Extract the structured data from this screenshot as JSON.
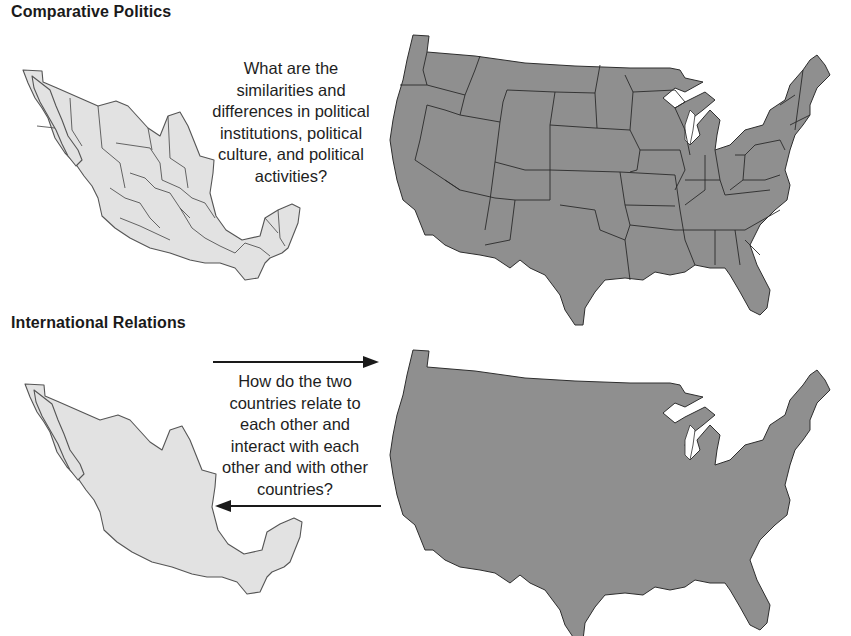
{
  "sections": [
    {
      "title": "Comparative Politics",
      "question_lines": [
        "What are the",
        "similarities and",
        "differences in political",
        "institutions, political",
        "culture, and political",
        "activities?"
      ],
      "left_map": "mexico-with-state-borders",
      "right_map": "usa-with-state-borders"
    },
    {
      "title": "International Relations",
      "question_lines": [
        "How do the two",
        "countries relate to",
        "each other and",
        "interact with each",
        "other and with other",
        "countries?"
      ],
      "left_map": "mexico-outline",
      "right_map": "usa-outline",
      "arrows": [
        "arrow-right-to-usa",
        "arrow-left-to-mexico"
      ]
    }
  ],
  "colors": {
    "mexico_fill": "#e2e2e2",
    "usa_fill": "#8f8f8f",
    "border": "#2e2e2e",
    "text": "#1a1a1a"
  }
}
